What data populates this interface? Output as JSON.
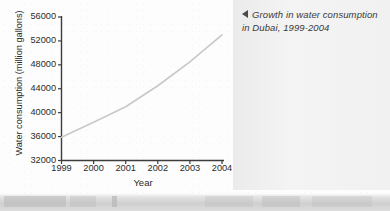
{
  "caption": {
    "arrow_icon": "left-triangle-icon",
    "text": "Growth in water consumption in Dubai, 1999-2004"
  },
  "colors": {
    "line": "#c9c9c9",
    "axis": "#3d3d3d",
    "text": "#2b2b2b",
    "panel_bg": "#f0f0f0",
    "page_bg": "#fdfdfd",
    "strip_bg": "#cfcfcf"
  },
  "chart_data": {
    "type": "line",
    "title": "Growth in water consumption in Dubai, 1999-2004",
    "xlabel": "Year",
    "ylabel": "Water consumption (million gallons)",
    "categories": [
      "1999",
      "2000",
      "2001",
      "2002",
      "2003",
      "2004"
    ],
    "x": [
      1999,
      2000,
      2001,
      2002,
      2003,
      2004
    ],
    "values": [
      35900,
      38400,
      41000,
      44500,
      48500,
      53000
    ],
    "ylim": [
      32000,
      56000
    ],
    "yticks": [
      32000,
      36000,
      40000,
      44000,
      48000,
      52000,
      56000
    ],
    "ytick_labels": [
      "32000",
      "36000",
      "40000",
      "44000",
      "48000",
      "52000",
      "56000"
    ],
    "xticks": [
      1999,
      2000,
      2001,
      2002,
      2003,
      2004
    ],
    "xtick_labels": [
      "1999",
      "2000",
      "2001",
      "2002",
      "2003",
      "2004"
    ],
    "grid": false,
    "legend": false,
    "series": [
      {
        "name": "Water consumption",
        "values": [
          35900,
          38400,
          41000,
          44500,
          48500,
          53000
        ]
      }
    ]
  }
}
